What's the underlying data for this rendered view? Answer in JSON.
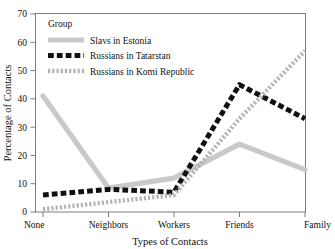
{
  "chart_data": {
    "type": "line",
    "title": "",
    "xlabel": "Types of Contacts",
    "ylabel": "Percentage of Contacts",
    "categories": [
      "None",
      "Neighbors",
      "Workers",
      "Friends",
      "Family"
    ],
    "ylim": [
      0,
      70
    ],
    "yticks": [
      0,
      10,
      20,
      30,
      40,
      50,
      60,
      70
    ],
    "ytick_labels": [
      "0",
      "10",
      "20",
      "30",
      "40",
      "50",
      "60",
      "70"
    ],
    "grid": false,
    "legend_position": "top-left",
    "legend_title": "Group",
    "series": [
      {
        "name": "Slavs in Estonia",
        "values": [
          41,
          8.5,
          12,
          24,
          15
        ],
        "color": "#c9c9c9",
        "style": "solid"
      },
      {
        "name": "Russians in Tatarstan",
        "values": [
          6,
          8,
          7,
          45,
          33
        ],
        "color": "#101010",
        "style": "dashed"
      },
      {
        "name": "Russians in Komi Republic",
        "values": [
          1,
          3.5,
          6,
          33,
          57
        ],
        "color": "#b4b4b4",
        "style": "dotted"
      }
    ]
  },
  "axes": {
    "x_title": "Types of Contacts",
    "y_title": "Percentage of Contacts",
    "x_categories": [
      "None",
      "Neighbors",
      "Workers",
      "Friends",
      "Family"
    ],
    "y_ticks": [
      "0",
      "10",
      "20",
      "30",
      "40",
      "50",
      "60",
      "70"
    ]
  },
  "legend": {
    "title": "Group",
    "entries": [
      {
        "label": "Slavs in Estonia"
      },
      {
        "label": "Russians in Tatarstan"
      },
      {
        "label": "Russians in Komi Republic"
      }
    ]
  }
}
